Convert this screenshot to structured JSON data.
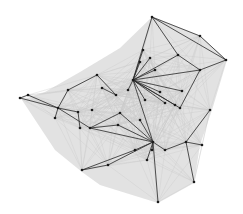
{
  "diagram": {
    "type": "network-graph",
    "background": "#ffffff",
    "hull_color": "#d8d8d8",
    "background_edge_color": "#c9c9c9",
    "highlight_edge_color": "#2a2a2a",
    "node_color": "#1a1a1a",
    "hull": [
      [
        152,
        17
      ],
      [
        200,
        36
      ],
      [
        227,
        60
      ],
      [
        212,
        110
      ],
      [
        200,
        145
      ],
      [
        194,
        183
      ],
      [
        158,
        203
      ],
      [
        100,
        185
      ],
      [
        82,
        172
      ],
      [
        55,
        150
      ],
      [
        22,
        100
      ],
      [
        45,
        92
      ],
      [
        80,
        72
      ],
      [
        120,
        48
      ]
    ],
    "nodes": [
      {
        "id": "n1",
        "x": 152,
        "y": 17
      },
      {
        "id": "n2",
        "x": 200,
        "y": 36
      },
      {
        "id": "n3",
        "x": 226,
        "y": 60
      },
      {
        "id": "n4",
        "x": 200,
        "y": 70
      },
      {
        "id": "n5",
        "x": 178,
        "y": 55
      },
      {
        "id": "n6",
        "x": 133,
        "y": 80
      },
      {
        "id": "n7",
        "x": 143,
        "y": 50
      },
      {
        "id": "n8",
        "x": 150,
        "y": 58
      },
      {
        "id": "n9",
        "x": 140,
        "y": 62
      },
      {
        "id": "n10",
        "x": 128,
        "y": 90
      },
      {
        "id": "n11",
        "x": 175,
        "y": 105
      },
      {
        "id": "n12",
        "x": 165,
        "y": 103
      },
      {
        "id": "n13",
        "x": 180,
        "y": 108
      },
      {
        "id": "n14",
        "x": 182,
        "y": 91
      },
      {
        "id": "n15",
        "x": 160,
        "y": 92
      },
      {
        "id": "n16",
        "x": 155,
        "y": 70
      },
      {
        "id": "n17",
        "x": 145,
        "y": 100
      },
      {
        "id": "n18",
        "x": 97,
        "y": 75
      },
      {
        "id": "n19",
        "x": 116,
        "y": 95
      },
      {
        "id": "n20",
        "x": 102,
        "y": 88
      },
      {
        "id": "n21",
        "x": 92,
        "y": 110
      },
      {
        "id": "n22",
        "x": 68,
        "y": 90
      },
      {
        "id": "n23",
        "x": 58,
        "y": 108
      },
      {
        "id": "n24",
        "x": 20,
        "y": 98
      },
      {
        "id": "n25",
        "x": 28,
        "y": 95
      },
      {
        "id": "n26",
        "x": 55,
        "y": 118
      },
      {
        "id": "n27",
        "x": 78,
        "y": 112
      },
      {
        "id": "n28",
        "x": 80,
        "y": 128
      },
      {
        "id": "n29",
        "x": 90,
        "y": 128
      },
      {
        "id": "n30",
        "x": 118,
        "y": 125
      },
      {
        "id": "n31",
        "x": 120,
        "y": 113
      },
      {
        "id": "n32",
        "x": 153,
        "y": 142
      },
      {
        "id": "n33",
        "x": 140,
        "y": 120
      },
      {
        "id": "n34",
        "x": 135,
        "y": 150
      },
      {
        "id": "n35",
        "x": 147,
        "y": 160
      },
      {
        "id": "n36",
        "x": 82,
        "y": 170
      },
      {
        "id": "n37",
        "x": 108,
        "y": 165
      },
      {
        "id": "n38",
        "x": 158,
        "y": 202
      },
      {
        "id": "n39",
        "x": 186,
        "y": 142
      },
      {
        "id": "n40",
        "x": 202,
        "y": 145
      },
      {
        "id": "n41",
        "x": 210,
        "y": 110
      },
      {
        "id": "n42",
        "x": 194,
        "y": 182
      },
      {
        "id": "n43",
        "x": 165,
        "y": 150
      },
      {
        "id": "n44",
        "x": 152,
        "y": 150
      }
    ],
    "highlight_edges": [
      [
        "n1",
        "n2"
      ],
      [
        "n2",
        "n3"
      ],
      [
        "n1",
        "n3"
      ],
      [
        "n1",
        "n5"
      ],
      [
        "n5",
        "n4"
      ],
      [
        "n3",
        "n4"
      ],
      [
        "n1",
        "n6"
      ],
      [
        "n6",
        "n7"
      ],
      [
        "n6",
        "n8"
      ],
      [
        "n6",
        "n9"
      ],
      [
        "n6",
        "n16"
      ],
      [
        "n6",
        "n4"
      ],
      [
        "n6",
        "n5"
      ],
      [
        "n6",
        "n14"
      ],
      [
        "n6",
        "n11"
      ],
      [
        "n6",
        "n12"
      ],
      [
        "n6",
        "n13"
      ],
      [
        "n6",
        "n15"
      ],
      [
        "n6",
        "n17"
      ],
      [
        "n6",
        "n10"
      ],
      [
        "n4",
        "n13"
      ],
      [
        "n6",
        "n32"
      ],
      [
        "n18",
        "n19"
      ],
      [
        "n19",
        "n20"
      ],
      [
        "n18",
        "n22"
      ],
      [
        "n22",
        "n23"
      ],
      [
        "n23",
        "n24"
      ],
      [
        "n24",
        "n25"
      ],
      [
        "n25",
        "n23"
      ],
      [
        "n23",
        "n26"
      ],
      [
        "n23",
        "n27"
      ],
      [
        "n27",
        "n28"
      ],
      [
        "n23",
        "n29"
      ],
      [
        "n29",
        "n31"
      ],
      [
        "n29",
        "n30"
      ],
      [
        "n29",
        "n32"
      ],
      [
        "n30",
        "n32"
      ],
      [
        "n33",
        "n32"
      ],
      [
        "n31",
        "n32"
      ],
      [
        "n32",
        "n34"
      ],
      [
        "n32",
        "n35"
      ],
      [
        "n34",
        "n36"
      ],
      [
        "n36",
        "n37"
      ],
      [
        "n37",
        "n32"
      ],
      [
        "n32",
        "n38"
      ],
      [
        "n32",
        "n43"
      ],
      [
        "n43",
        "n39"
      ],
      [
        "n39",
        "n40"
      ],
      [
        "n39",
        "n41"
      ],
      [
        "n39",
        "n42"
      ],
      [
        "n32",
        "n44"
      ]
    ]
  }
}
